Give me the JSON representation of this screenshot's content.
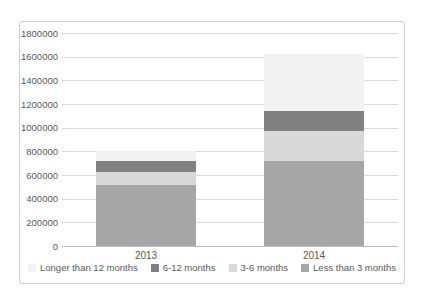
{
  "chart_data": {
    "type": "bar",
    "stacked": true,
    "title": "",
    "xlabel": "",
    "ylabel": "",
    "categories": [
      "2013",
      "2014"
    ],
    "series": [
      {
        "name": "Less than 3 months",
        "color": "#a6a6a6",
        "values": [
          515000,
          720000
        ]
      },
      {
        "name": "3-6 months",
        "color": "#d9d9d9",
        "values": [
          110000,
          255000
        ]
      },
      {
        "name": "6-12 months",
        "color": "#808080",
        "values": [
          95000,
          165000
        ]
      },
      {
        "name": "Longer than 12 months",
        "color": "#f2f2f2",
        "values": [
          80000,
          485000
        ]
      }
    ],
    "totals": [
      800000,
      1625000
    ],
    "legend": [
      "Longer than 12 months",
      "6-12 months",
      "3-6 months",
      "Less than 3 months"
    ],
    "legend_position": "bottom",
    "y_ticks": [
      0,
      200000,
      400000,
      600000,
      800000,
      1000000,
      1200000,
      1400000,
      1600000,
      1800000
    ],
    "ylim": [
      0,
      1800000
    ],
    "grid": true
  },
  "colors": {
    "background": "#ffffff",
    "frame_border": "#cfcfcf",
    "gridline": "#d9d9d9",
    "axis_line": "#bfbfbf",
    "text": "#595959"
  }
}
